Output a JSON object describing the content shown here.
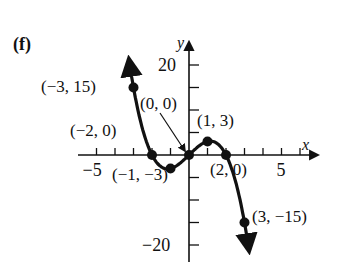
{
  "panel_label": "(f)",
  "chart_data": {
    "type": "line",
    "title": "",
    "xlabel": "x",
    "ylabel": "y",
    "xlim": [
      -5.9,
      7.1
    ],
    "ylim": [
      -23,
      24
    ],
    "x_ticks_step": 1,
    "y_ticks_step": 5,
    "x_tick_labels": [
      {
        "value": -5,
        "label": "−5"
      },
      {
        "value": 5,
        "label": "5"
      }
    ],
    "y_tick_labels": [
      {
        "value": 20,
        "label": "20"
      },
      {
        "value": -20,
        "label": "−20"
      }
    ],
    "grid": false,
    "legend": null,
    "function": "f(x) = x^3 ... cubic-like curve through plotted points",
    "series": [
      {
        "name": "f",
        "points": [
          {
            "x": -3,
            "y": 15,
            "label": "(−3, 15)"
          },
          {
            "x": -2,
            "y": 0,
            "label": "(−2, 0)"
          },
          {
            "x": -1,
            "y": -3,
            "label": "(−1, −3)"
          },
          {
            "x": 0,
            "y": 0,
            "label": "(0, 0)"
          },
          {
            "x": 1,
            "y": 3,
            "label": "(1, 3)"
          },
          {
            "x": 2,
            "y": 0,
            "label": "(2, 0)"
          },
          {
            "x": 3,
            "y": -15,
            "label": "(3, −15)"
          }
        ],
        "ends": "arrows at both ends (up-left beyond x=-3, down-right beyond x=3)"
      }
    ],
    "annotations": [
      {
        "text": "(0, 0)",
        "arrow_to": [
          0,
          0
        ]
      }
    ]
  }
}
